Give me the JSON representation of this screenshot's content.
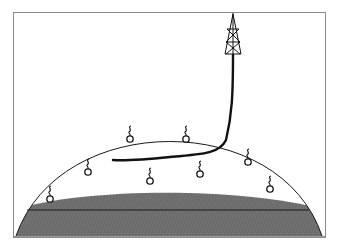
{
  "diagram": {
    "colors": {
      "frame": "#8a8a8a",
      "outline": "#1a1a1a",
      "water_zone": "#6e6e6e",
      "background": "#ffffff"
    },
    "elements": {
      "derrick": {
        "label": "drilling-rig",
        "x": 233,
        "top": 12,
        "bottom": 55
      },
      "wellbore": {
        "label": "horizontal-wellbore",
        "start": [
          233,
          55
        ],
        "end": [
          113,
          160
        ]
      },
      "reservoir_dome": {
        "label": "anticline-reservoir",
        "apex": [
          170,
          116
        ],
        "left_base": [
          16,
          235
        ],
        "right_base": [
          322,
          235
        ]
      },
      "water_zone": {
        "label": "aquifer-water-zone",
        "top_y": 193,
        "contact_y": 210
      },
      "oil_water_contact": {
        "label": "fluid-contact-line",
        "y": 210
      },
      "hydrocarbon_droplets": [
        {
          "x": 130,
          "y": 135
        },
        {
          "x": 186,
          "y": 135
        },
        {
          "x": 248,
          "y": 158
        },
        {
          "x": 88,
          "y": 168
        },
        {
          "x": 150,
          "y": 177
        },
        {
          "x": 200,
          "y": 170
        },
        {
          "x": 270,
          "y": 185
        },
        {
          "x": 50,
          "y": 195
        }
      ]
    }
  }
}
